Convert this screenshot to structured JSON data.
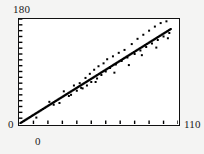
{
  "axes": {
    "y_max_label": "180",
    "y_min_label": "0",
    "x_max_label": "110",
    "x_min_label": "0"
  },
  "style": {
    "frame_color": "#111111",
    "point_color": "#000000",
    "plot_bg": "#ffffff",
    "page_bg": "#f4f4f3"
  },
  "chart_data": {
    "type": "scatter",
    "title": "",
    "xlabel": "",
    "ylabel": "",
    "xlim": [
      0,
      110
    ],
    "ylim": [
      0,
      180
    ],
    "grid": false,
    "legend": null,
    "xticks": [
      0,
      10,
      20,
      30,
      40,
      50,
      60,
      70,
      80,
      90,
      100,
      110
    ],
    "yticks": [
      0,
      10,
      20,
      30,
      40,
      50,
      60,
      70,
      80,
      90,
      100,
      110,
      120,
      130,
      140,
      150,
      160,
      170,
      180
    ],
    "tick_direction": "in",
    "tick_labels_shown": [
      "axis endpoints only"
    ],
    "marker": "square",
    "marker_size_px": 2,
    "series": [
      {
        "name": "observations",
        "x": [
          1.0,
          1.6,
          2.2,
          2.9,
          3.4,
          4.0,
          4.6,
          5.2,
          5.8,
          6.5,
          7.1,
          7.7,
          8.3,
          9.0,
          9.6,
          10.2,
          10.9,
          11.5,
          12.1,
          12.8,
          13.4,
          14.0,
          14.7,
          15.3,
          16.0,
          16.6,
          17.2,
          17.9,
          18.5,
          19.1,
          19.8,
          20.4,
          21.0,
          21.7,
          22.3,
          23.0,
          23.6,
          24.2,
          24.9,
          25.5,
          26.1,
          26.8,
          27.4,
          28.0,
          28.7,
          29.3,
          30.0,
          30.6,
          31.2,
          31.9,
          32.5,
          33.1,
          33.8,
          34.4,
          35.0,
          35.7,
          36.3,
          37.0,
          37.6,
          38.2,
          38.9,
          39.5,
          40.1,
          40.8,
          41.4,
          42.0,
          42.7,
          43.3,
          44.0,
          44.6,
          45.2,
          45.9,
          46.5,
          47.1,
          47.8,
          48.4,
          49.0,
          49.7,
          50.3,
          51.0,
          51.6,
          52.2,
          52.9,
          53.5,
          54.1,
          54.8,
          55.4,
          56.0,
          56.7,
          57.3,
          58.0,
          58.6,
          59.2,
          59.9,
          60.5,
          61.1,
          61.8,
          62.4,
          63.0,
          63.7,
          64.3,
          65.0,
          65.6,
          66.2,
          66.9,
          67.5,
          68.1,
          68.8,
          69.4,
          70.0,
          70.7,
          71.3,
          72.0,
          72.6,
          73.2,
          73.9,
          74.5,
          75.1,
          75.8,
          76.4,
          77.0,
          77.7,
          78.3,
          79.0,
          79.6,
          80.2,
          80.9,
          81.5,
          82.1,
          82.8,
          83.4,
          84.0,
          84.7,
          85.3,
          86.0,
          86.6,
          87.2,
          87.9,
          88.5,
          89.1,
          89.8,
          90.4,
          91.0,
          91.7,
          92.3,
          93.0,
          93.6,
          94.2,
          94.9,
          95.5,
          96.1,
          96.8,
          97.4,
          98.0,
          98.7,
          99.3,
          100.0,
          100.6,
          101.2,
          101.9,
          102.5,
          103.1,
          103.8,
          104.4,
          105.0
        ],
        "y": [
          1.5,
          2.5,
          3.4,
          4.5,
          5.3,
          6.2,
          7.1,
          8.1,
          9.0,
          10.1,
          11.0,
          11.9,
          12.9,
          14.0,
          14.9,
          15.8,
          16.9,
          17.8,
          18.8,
          19.8,
          20.8,
          21.7,
          22.8,
          23.7,
          24.8,
          25.7,
          26.7,
          27.7,
          28.7,
          29.6,
          30.7,
          31.6,
          32.6,
          33.6,
          34.6,
          35.6,
          36.6,
          37.5,
          38.6,
          39.5,
          40.5,
          41.5,
          42.5,
          43.4,
          44.5,
          45.4,
          46.5,
          47.4,
          48.4,
          49.4,
          50.4,
          51.3,
          52.4,
          53.3,
          54.3,
          55.3,
          56.3,
          57.3,
          58.3,
          59.2,
          60.3,
          61.2,
          62.2,
          63.2,
          64.2,
          65.1,
          66.2,
          67.1,
          68.2,
          69.1,
          70.1,
          71.1,
          72.1,
          73.0,
          74.1,
          75.0,
          76.0,
          77.0,
          78.0,
          79.0,
          80.0,
          80.9,
          82.0,
          82.9,
          83.9,
          84.9,
          85.9,
          86.8,
          87.9,
          88.8,
          89.9,
          90.8,
          91.8,
          92.8,
          93.8,
          94.7,
          95.8,
          96.7,
          97.7,
          98.7,
          99.7,
          100.7,
          101.7,
          102.6,
          103.7,
          104.6,
          105.6,
          106.6,
          107.6,
          108.5,
          109.6,
          110.5,
          111.6,
          112.5,
          113.5,
          114.5,
          115.5,
          116.4,
          117.5,
          118.4,
          119.4,
          120.4,
          121.4,
          122.4,
          123.4,
          124.3,
          125.4,
          126.3,
          127.3,
          128.3,
          129.3,
          130.2,
          131.3,
          132.2,
          133.3,
          134.2,
          135.2,
          136.2,
          137.2,
          138.1,
          139.2,
          140.1,
          141.1,
          142.1,
          143.1,
          144.1,
          145.1,
          146.0,
          147.1,
          148.0,
          149.0,
          150.0,
          151.0,
          151.9,
          153.0,
          153.9,
          155.0,
          155.9,
          156.9,
          157.9,
          158.9,
          159.8,
          160.9,
          161.8,
          162.8
        ]
      },
      {
        "name": "scatter-outliers",
        "x": [
          12.0,
          21.0,
          24.0,
          31.0,
          34.5,
          38.0,
          40.0,
          42.0,
          44.0,
          46.0,
          47.0,
          49.0,
          50.0,
          52.0,
          54.0,
          55.0,
          57.0,
          58.5,
          60.0,
          61.0,
          63.0,
          65.0,
          67.0,
          69.0,
          71.0,
          73.0,
          75.0,
          78.0,
          80.0,
          82.0,
          84.0,
          86.0,
          88.0,
          90.0,
          92.0,
          94.0,
          96.0,
          98.0,
          100.0,
          102.0,
          104.0,
          36.0,
          43.0,
          53.0,
          66.0,
          76.0,
          85.0,
          95.0,
          103.0,
          28.0
        ],
        "y": [
          11.0,
          38.0,
          33.0,
          56.0,
          48.0,
          66.0,
          57.0,
          70.0,
          61.0,
          79.0,
          66.0,
          86.0,
          72.0,
          93.0,
          78.0,
          99.0,
          84.0,
          104.0,
          90.0,
          111.0,
          96.0,
          116.0,
          102.0,
          122.0,
          108.0,
          127.0,
          114.0,
          137.0,
          120.0,
          146.0,
          126.0,
          153.0,
          132.0,
          160.0,
          138.0,
          167.0,
          144.0,
          173.0,
          150.0,
          176.0,
          156.0,
          50.0,
          62.0,
          72.0,
          88.0,
          101.0,
          118.0,
          131.0,
          147.0,
          36.0
        ]
      }
    ],
    "trend": {
      "type": "linear",
      "x": [
        0,
        105
      ],
      "y": [
        0,
        163
      ],
      "slope": 1.552,
      "intercept": 0
    }
  }
}
